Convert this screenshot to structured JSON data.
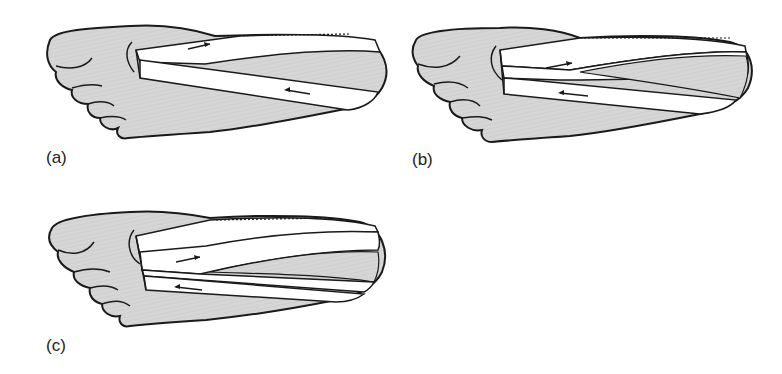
{
  "figure": {
    "panels": [
      {
        "id": "a",
        "label": "(a)",
        "strips": 2,
        "description": "Foot sole with one tape strip looping around heel"
      },
      {
        "id": "b",
        "label": "(b)",
        "strips": 3,
        "description": "Foot sole with two overlapping tape strips"
      },
      {
        "id": "c",
        "label": "(c)",
        "strips": 4,
        "description": "Foot sole with multiple overlapping tape strips"
      }
    ],
    "colors": {
      "skin_fill": "#d4d4d4",
      "outline": "#1a1a1a",
      "tape_fill": "#ffffff",
      "background": "#ffffff"
    }
  }
}
